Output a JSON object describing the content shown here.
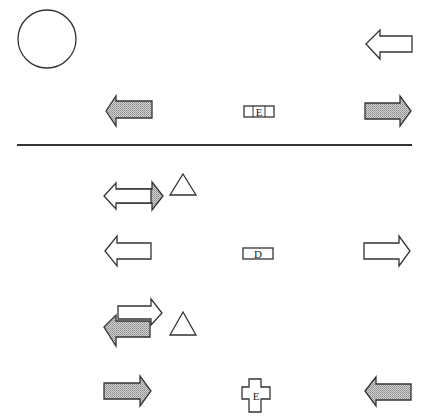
{
  "diagram": {
    "divider": {
      "y": 145,
      "x1": 17,
      "x2": 412,
      "color": "#333333"
    },
    "colors": {
      "stroke": "#333333",
      "shade": "#b8b8b8",
      "background": "#ffffff"
    },
    "top_panel": {
      "circle": {
        "cx": 47,
        "cy": 39,
        "r": 29,
        "fill": "none"
      },
      "arrows": [
        {
          "id": "top-right-left-arrow",
          "direction": "left",
          "fill": "outline",
          "x": 387,
          "y": 35
        },
        {
          "id": "mid-left-left-arrow",
          "direction": "left",
          "fill": "shaded",
          "x": 106,
          "y": 108
        },
        {
          "id": "mid-right-right-arrow",
          "direction": "right",
          "fill": "shaded",
          "x": 365,
          "y": 108
        }
      ],
      "label_box": {
        "text": "E",
        "shape": "rectangle",
        "x": 244,
        "y": 104
      }
    },
    "bottom_panel": {
      "rows": [
        {
          "name": "row-1",
          "arrows": [
            {
              "direction": "right",
              "fill": "shaded",
              "layer": "back"
            },
            {
              "direction": "left",
              "fill": "outline",
              "layer": "front"
            }
          ],
          "triangle": {
            "fill": "outline"
          }
        },
        {
          "name": "row-2",
          "arrows": [
            {
              "direction": "left",
              "fill": "outline",
              "x": 106
            },
            {
              "direction": "right",
              "fill": "outline",
              "x": 365
            }
          ],
          "label_box": {
            "text": "D",
            "shape": "rectangle"
          }
        },
        {
          "name": "row-3",
          "arrows": [
            {
              "direction": "right",
              "fill": "outline",
              "layer": "back"
            },
            {
              "direction": "left",
              "fill": "shaded",
              "layer": "front"
            }
          ],
          "triangle": {
            "fill": "outline"
          }
        },
        {
          "name": "row-4",
          "arrows": [
            {
              "direction": "right",
              "fill": "shaded",
              "x": 106
            },
            {
              "direction": "left",
              "fill": "shaded",
              "x": 365
            }
          ],
          "label_box": {
            "text": "E",
            "shape": "cross"
          }
        }
      ]
    }
  }
}
